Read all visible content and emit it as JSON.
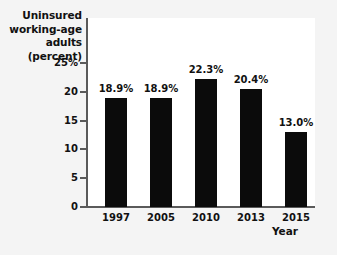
{
  "chart_data": {
    "type": "bar",
    "title": "",
    "subtitle": "",
    "xlabel": "Year",
    "ylabel": "Uninsured working-age adults (percent)",
    "ylabel_lines": [
      "Uninsured",
      "working-age",
      "adults (percent)"
    ],
    "categories": [
      "1997",
      "2005",
      "2010",
      "2013",
      "2015"
    ],
    "values": [
      18.9,
      18.9,
      22.3,
      20.4,
      13.0
    ],
    "data_labels": [
      "18.9%",
      "18.9%",
      "22.3%",
      "20.4%",
      "13.0%"
    ],
    "ylim": [
      0,
      25
    ],
    "y_ticks": [
      0,
      5,
      10,
      15,
      20,
      25
    ],
    "y_tick_labels": [
      "0",
      "5",
      "10",
      "15",
      "20",
      "25%"
    ],
    "grid": false,
    "legend": null,
    "bar_color": "#0b0b0b",
    "axis_color": "#5a5a5a",
    "plot_background": "#ffffff",
    "page_background": "#f4f4f4",
    "text_color": "#111111"
  }
}
